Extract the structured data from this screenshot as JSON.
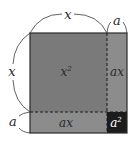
{
  "diagram": {
    "dimension_labels": {
      "top_x": "x",
      "top_a": "a",
      "left_x": "x",
      "left_a": "a"
    },
    "regions": [
      {
        "name": "x-squared",
        "label": "x",
        "superscript": "2",
        "color": "#7a7a7a"
      },
      {
        "name": "ax-right",
        "label": "ax",
        "color": "#8c8c8c"
      },
      {
        "name": "ax-bottom",
        "label": "ax",
        "color": "#8c8c8c"
      },
      {
        "name": "a-squared",
        "label": "a",
        "superscript": "2",
        "color": "#1c1c1c"
      }
    ],
    "colors": {
      "border": "#2a2a2a",
      "dashed": "#1a1a1a",
      "background": "#ffffff"
    }
  }
}
